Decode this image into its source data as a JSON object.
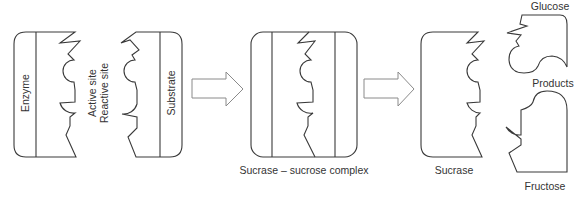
{
  "diagram": {
    "labels": {
      "enzyme": "Enzyme",
      "active_site": "Active site",
      "reactive_site": "Reactive site",
      "substrate": "Substrate",
      "complex": "Sucrase – sucrose complex",
      "sucrase": "Sucrase",
      "glucose": "Glucose",
      "products": "Products",
      "fructose": "Fructose"
    },
    "arrows": [
      {
        "from": "enzyme-substrate",
        "to": "complex"
      },
      {
        "from": "complex",
        "to": "products"
      }
    ],
    "colors": {
      "stroke": "#3a3a3a",
      "arrow_stroke": "#8a8a8a",
      "text": "#333333",
      "background": "#ffffff"
    }
  }
}
